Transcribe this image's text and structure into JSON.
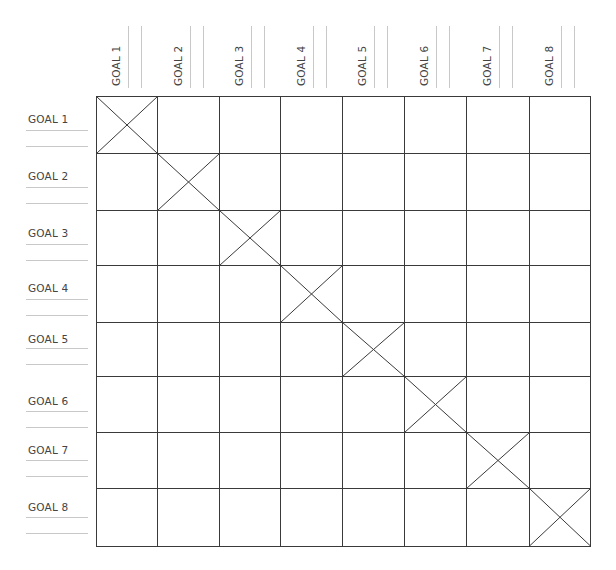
{
  "matrix": {
    "title": "",
    "column_headers": [
      "GOAL 1",
      "GOAL 2",
      "GOAL 3",
      "GOAL 4",
      "GOAL 5",
      "GOAL 6",
      "GOAL 7",
      "GOAL 8"
    ],
    "row_headers": [
      "GOAL 1",
      "GOAL 2",
      "GOAL 3",
      "GOAL 4",
      "GOAL 5",
      "GOAL 6",
      "GOAL 7",
      "GOAL 8"
    ],
    "diagonal_marker": "x-mark",
    "cells": [
      [
        "x",
        "",
        "",
        "",
        "",
        "",
        "",
        ""
      ],
      [
        "",
        "x",
        "",
        "",
        "",
        "",
        "",
        ""
      ],
      [
        "",
        "",
        "x",
        "",
        "",
        "",
        "",
        ""
      ],
      [
        "",
        "",
        "",
        "x",
        "",
        "",
        "",
        ""
      ],
      [
        "",
        "",
        "",
        "",
        "x",
        "",
        "",
        ""
      ],
      [
        "",
        "",
        "",
        "",
        "",
        "x",
        "",
        ""
      ],
      [
        "",
        "",
        "",
        "",
        "",
        "",
        "x",
        ""
      ],
      [
        "",
        "",
        "",
        "",
        "",
        "",
        "",
        "x"
      ]
    ]
  },
  "colors": {
    "grid_line": "#3a3a3a",
    "guide_line": "#c8c8c8",
    "label_text": "#444444",
    "background": "#ffffff"
  }
}
